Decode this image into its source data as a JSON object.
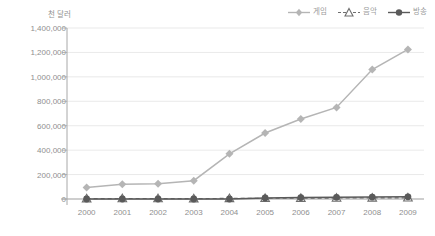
{
  "chart_data": {
    "type": "line",
    "title": "",
    "xlabel": "",
    "ylabel": "천 달러",
    "categories": [
      "2000",
      "2001",
      "2002",
      "2003",
      "2004",
      "2005",
      "2006",
      "2007",
      "2008",
      "2009"
    ],
    "ylim": [
      0,
      1400000
    ],
    "ytick_labels": [
      "1,400,000",
      "1,200,000",
      "1,000,000",
      "800,000",
      "600,000",
      "400,000",
      "200,000",
      "0"
    ],
    "ytick_values": [
      1400000,
      1200000,
      1000000,
      800000,
      600000,
      400000,
      200000,
      0
    ],
    "grid": true,
    "legend_position": "top-right",
    "series": [
      {
        "name": "게임",
        "marker": "diamond",
        "line_style": "solid",
        "color": "#b5b5b5",
        "values": [
          95000,
          120000,
          125000,
          150000,
          370000,
          540000,
          655000,
          750000,
          1060000,
          1225000
        ]
      },
      {
        "name": "음악",
        "marker": "triangle-open",
        "line_style": "dashed",
        "color": "#6e6e6e",
        "values": [
          3000,
          4000,
          4000,
          3000,
          5000,
          6000,
          7000,
          8000,
          9000,
          10000
        ]
      },
      {
        "name": "방송",
        "marker": "circle-filled",
        "line_style": "solid",
        "color": "#5a5a5a",
        "values": [
          0,
          0,
          0,
          0,
          0,
          8000,
          12000,
          14000,
          16000,
          18000
        ]
      }
    ]
  },
  "colors": {
    "game": "#b5b5b5",
    "music": "#6e6e6e",
    "broadcast": "#5a5a5a",
    "axis": "#a8a8a8",
    "grid": "#e3e3e3",
    "text": "#8f8f8f"
  }
}
